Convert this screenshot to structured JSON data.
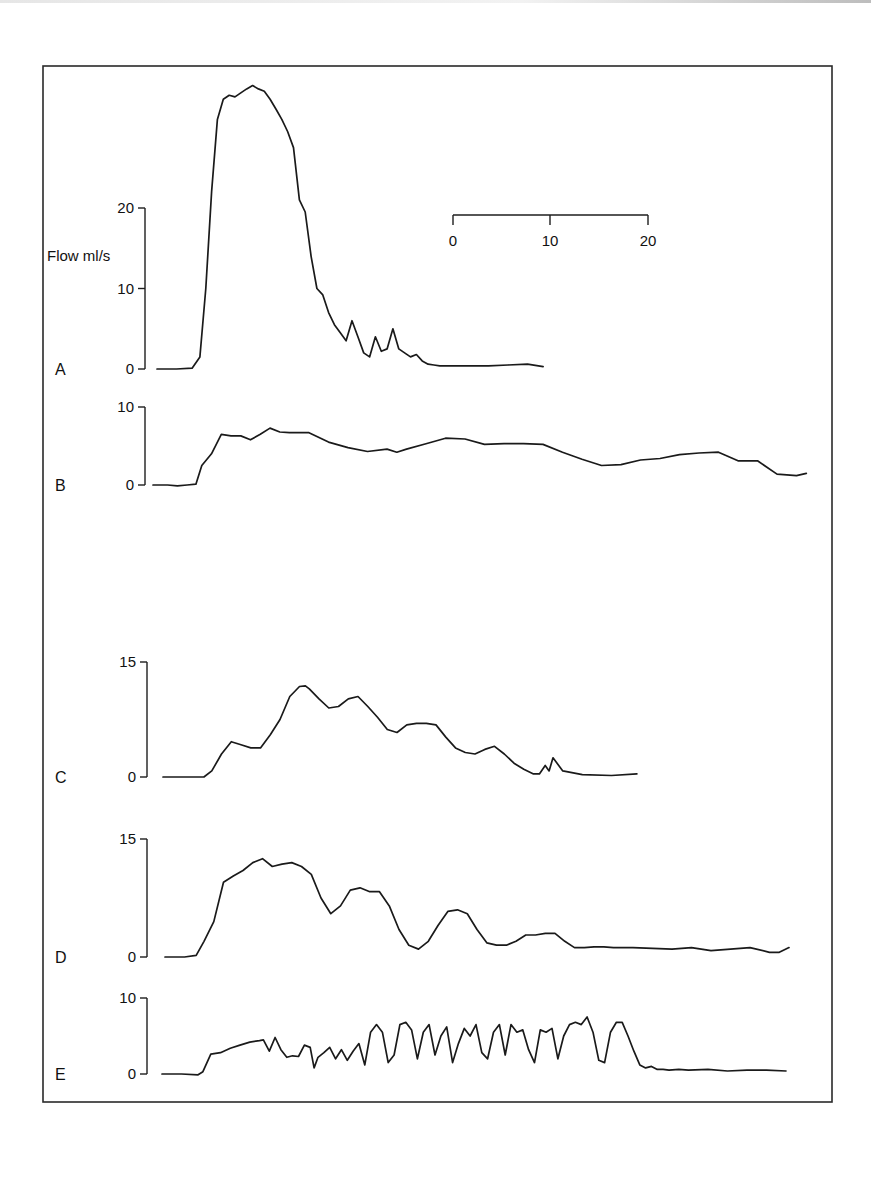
{
  "chart_data": {
    "type": "line",
    "title": "",
    "ylabel": "Flow ml/s",
    "xlabel": "",
    "time_scale_bar": {
      "ticks": [
        0,
        10,
        20
      ],
      "labels": [
        "0",
        "10",
        "20"
      ],
      "unit": "s"
    },
    "grid": false,
    "panels": [
      {
        "label": "A",
        "ylim": [
          0,
          20
        ],
        "yticks": [
          0,
          10,
          20
        ],
        "ytick_labels": [
          "0",
          "10",
          "20"
        ],
        "x": [
          0,
          2,
          3.6,
          4.4,
          5.0,
          5.6,
          6.2,
          6.8,
          7.4,
          8.0,
          8.6,
          9.2,
          9.8,
          10.4,
          11.0,
          11.6,
          12.2,
          12.8,
          13.4,
          14.0,
          14.6,
          15.2,
          15.8,
          16.4,
          17.0,
          17.6,
          18.2,
          18.8,
          19.4,
          20.0,
          20.6,
          21.2,
          21.8,
          22.4,
          23.0,
          23.6,
          24.2,
          24.8,
          25.4,
          26.0,
          26.6,
          27.2,
          27.8,
          28.4,
          29.0,
          29.6,
          30.2,
          30.8,
          32.0,
          34.0,
          36.0,
          38.0,
          39.6
        ],
        "y": [
          0,
          0,
          0.1,
          1.5,
          10,
          22,
          31,
          33.5,
          34,
          33.8,
          34.3,
          34.8,
          35.2,
          34.8,
          34.5,
          33.5,
          32.3,
          31,
          29.5,
          27.5,
          21,
          19.5,
          14,
          10,
          9.2,
          7,
          5.5,
          4.5,
          3.5,
          6,
          4,
          2,
          1.5,
          4,
          2.2,
          2.5,
          5,
          2.5,
          2,
          1.5,
          1.8,
          1,
          0.6,
          0.5,
          0.4,
          0.4,
          0.4,
          0.4,
          0.4,
          0.4,
          0.5,
          0.6,
          0.3
        ]
      },
      {
        "label": "B",
        "ylim": [
          0,
          10
        ],
        "yticks": [
          0,
          10
        ],
        "ytick_labels": [
          "0",
          "10"
        ],
        "x": [
          0,
          1.5,
          2.5,
          3.5,
          4.4,
          5.0,
          6.0,
          7.0,
          8.0,
          9.0,
          10.0,
          11.0,
          12.0,
          13.0,
          14.0,
          15.0,
          16.0,
          18.0,
          20.0,
          22.0,
          24.0,
          25.0,
          26.0,
          28.0,
          30.0,
          32.0,
          34.0,
          36.0,
          38.0,
          40.0,
          42.0,
          44.0,
          46.0,
          48.0,
          50.0,
          52.0,
          54.0,
          56.0,
          58.0,
          60.0,
          62.0,
          64.0,
          66.0,
          67.0
        ],
        "y": [
          0,
          0,
          -0.1,
          0,
          0.1,
          2.5,
          4,
          6.5,
          6.3,
          6.3,
          5.8,
          6.5,
          7.3,
          6.8,
          6.7,
          6.7,
          6.7,
          5.5,
          4.8,
          4.3,
          4.6,
          4.2,
          4.6,
          5.3,
          6.0,
          5.9,
          5.2,
          5.3,
          5.3,
          5.2,
          4.2,
          3.3,
          2.5,
          2.6,
          3.2,
          3.4,
          3.9,
          4.1,
          4.2,
          3.1,
          3.1,
          1.4,
          1.2,
          1.5
        ]
      },
      {
        "label": "C",
        "ylim": [
          0,
          15
        ],
        "yticks": [
          0,
          15
        ],
        "ytick_labels": [
          "0",
          "15"
        ],
        "x": [
          0,
          2,
          4.2,
          5.0,
          6.0,
          7.0,
          8.0,
          9.0,
          10.0,
          11.0,
          12.0,
          13.0,
          14.0,
          14.6,
          15.0,
          16.0,
          17.0,
          18.0,
          19.0,
          20.0,
          21.0,
          22.0,
          23.0,
          24.0,
          25.0,
          26.0,
          27.0,
          28.0,
          29.0,
          30.0,
          31.0,
          32.0,
          33.0,
          34.0,
          35.0,
          36.0,
          37.0,
          38.0,
          38.6,
          39.2,
          39.6,
          40.0,
          41.0,
          43.0,
          46.0,
          48.6
        ],
        "y": [
          0,
          0,
          0,
          0.8,
          3,
          4.6,
          4.2,
          3.8,
          3.8,
          5.5,
          7.5,
          10.5,
          11.8,
          11.9,
          11.5,
          10.2,
          9.0,
          9.2,
          10.2,
          10.5,
          9.2,
          7.8,
          6.2,
          5.8,
          6.8,
          7.0,
          7.0,
          6.8,
          5.2,
          3.8,
          3.2,
          3.0,
          3.6,
          4.0,
          3.0,
          1.8,
          1.0,
          0.4,
          0.4,
          1.5,
          0.8,
          2.5,
          0.8,
          0.3,
          0.2,
          0.4
        ]
      },
      {
        "label": "D",
        "ylim": [
          0,
          15
        ],
        "yticks": [
          0,
          15
        ],
        "ytick_labels": [
          "0",
          "15"
        ],
        "x": [
          0,
          2,
          3.2,
          4.0,
          5.0,
          6.0,
          7.0,
          8.0,
          9.0,
          10.0,
          11.0,
          12.0,
          13.0,
          14.0,
          15.0,
          16.0,
          17.0,
          18.0,
          19.0,
          20.0,
          21.0,
          22.0,
          23.0,
          24.0,
          25.0,
          26.0,
          27.0,
          28.0,
          29.0,
          30.0,
          31.0,
          32.0,
          33.0,
          34.0,
          35.0,
          36.0,
          37.0,
          38.0,
          39.0,
          40.0,
          41.0,
          42.0,
          43.0,
          44.0,
          45.0,
          46.0,
          47.0,
          48.0,
          50.0,
          52.0,
          54.0,
          56.0,
          58.0,
          60.0,
          62.0,
          63.0,
          64.0
        ],
        "y": [
          0,
          0,
          0.2,
          2.0,
          4.5,
          9.5,
          10.3,
          11.0,
          12.0,
          12.5,
          11.5,
          11.8,
          12.0,
          11.5,
          10.5,
          7.5,
          5.5,
          6.5,
          8.5,
          8.8,
          8.3,
          8.3,
          6.5,
          3.5,
          1.5,
          1.0,
          2.0,
          4.0,
          5.8,
          6.0,
          5.5,
          3.5,
          1.8,
          1.5,
          1.5,
          2.0,
          2.8,
          2.8,
          3.0,
          3.0,
          2.0,
          1.2,
          1.2,
          1.3,
          1.3,
          1.2,
          1.2,
          1.2,
          1.1,
          1.0,
          1.2,
          0.8,
          1.0,
          1.2,
          0.6,
          0.6,
          1.2
        ]
      },
      {
        "label": "E",
        "ylim": [
          0,
          10
        ],
        "yticks": [
          0,
          10
        ],
        "ytick_labels": [
          "0",
          "10"
        ],
        "x": [
          0,
          2,
          3.7,
          4.2,
          5.0,
          6.0,
          7.0,
          8.0,
          9.0,
          10.0,
          10.4,
          11.0,
          11.6,
          12.2,
          12.8,
          13.4,
          14.0,
          14.6,
          15.2,
          15.6,
          16.0,
          16.6,
          17.2,
          17.8,
          18.4,
          19.0,
          19.6,
          20.2,
          20.8,
          21.4,
          22.0,
          22.6,
          23.2,
          23.8,
          24.4,
          25.0,
          25.6,
          26.2,
          26.8,
          27.4,
          28.0,
          28.6,
          29.2,
          29.8,
          30.4,
          31.0,
          31.6,
          32.2,
          32.8,
          33.4,
          34.0,
          34.6,
          35.2,
          35.8,
          36.4,
          37.0,
          37.6,
          38.2,
          38.8,
          39.4,
          40.0,
          40.6,
          41.2,
          41.8,
          42.4,
          43.0,
          43.6,
          44.2,
          44.8,
          45.4,
          46.0,
          46.6,
          47.2,
          47.8,
          48.4,
          49.0,
          49.6,
          50.2,
          50.8,
          51.4,
          52.0,
          53.0,
          54.0,
          56.0,
          58.0,
          60.0,
          62.0,
          64.0
        ],
        "y": [
          0,
          0,
          -0.1,
          0.3,
          2.6,
          2.8,
          3.4,
          3.8,
          4.2,
          4.4,
          4.5,
          3.0,
          4.8,
          3.2,
          2.2,
          2.4,
          2.3,
          3.8,
          3.5,
          0.8,
          2.2,
          2.8,
          3.5,
          2.0,
          3.2,
          1.8,
          3.0,
          4.0,
          1.2,
          5.5,
          6.5,
          5.5,
          1.5,
          2.5,
          6.5,
          6.8,
          5.8,
          2.0,
          5.5,
          6.5,
          2.5,
          5.0,
          6.2,
          1.5,
          4.0,
          6.0,
          5.0,
          6.5,
          2.8,
          2.0,
          5.5,
          6.5,
          2.5,
          6.5,
          5.5,
          5.8,
          3.2,
          1.5,
          5.8,
          5.5,
          6.0,
          2.0,
          5.0,
          6.5,
          6.8,
          6.5,
          7.5,
          5.5,
          1.8,
          1.5,
          5.5,
          6.8,
          6.8,
          5.0,
          3.0,
          1.2,
          0.8,
          1.0,
          0.6,
          0.6,
          0.5,
          0.6,
          0.5,
          0.6,
          0.4,
          0.5,
          0.5,
          0.4
        ]
      }
    ],
    "legend": null
  }
}
